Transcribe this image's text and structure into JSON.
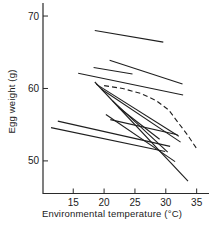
{
  "figure": {
    "background": "#ffffff",
    "line_color": "#1f1f1f",
    "axis_color": "#2a2a2a",
    "text_color": "#1a1a1a"
  },
  "chart_data": {
    "type": "line",
    "title": "",
    "xlabel": "Environmental temperature (°C)",
    "ylabel": "Egg weight (g)",
    "xlim": [
      10.1,
      37.0
    ],
    "ylim": [
      45.5,
      71.8
    ],
    "x_ticks": [
      15,
      20,
      25,
      30,
      35
    ],
    "y_ticks": [
      50,
      60,
      70
    ],
    "grid": false,
    "legend": "none",
    "series": [
      {
        "name": "line-1",
        "style": "solid",
        "points": [
          [
            18.5,
            68.0
          ],
          [
            29.6,
            66.4
          ]
        ]
      },
      {
        "name": "line-2",
        "style": "solid",
        "points": [
          [
            20.9,
            63.9
          ],
          [
            32.7,
            60.6
          ]
        ]
      },
      {
        "name": "line-3",
        "style": "solid",
        "points": [
          [
            15.8,
            62.1
          ],
          [
            32.8,
            59.1
          ]
        ]
      },
      {
        "name": "line-4",
        "style": "solid",
        "points": [
          [
            18.3,
            62.9
          ],
          [
            24.6,
            62.0
          ]
        ]
      },
      {
        "name": "line-5",
        "style": "solid",
        "points": [
          [
            18.5,
            60.9
          ],
          [
            33.6,
            47.2
          ]
        ]
      },
      {
        "name": "line-6",
        "style": "solid",
        "points": [
          [
            18.7,
            60.6
          ],
          [
            32.1,
            53.4
          ]
        ]
      },
      {
        "name": "line-7",
        "style": "solid",
        "points": [
          [
            19.6,
            59.9
          ],
          [
            32.4,
            52.6
          ]
        ]
      },
      {
        "name": "line-8",
        "style": "solid",
        "points": [
          [
            21.4,
            58.3
          ],
          [
            30.3,
            51.2
          ]
        ]
      },
      {
        "name": "line-9",
        "style": "solid",
        "points": [
          [
            22.3,
            57.4
          ],
          [
            29.0,
            53.0
          ]
        ]
      },
      {
        "name": "line-10",
        "style": "solid",
        "points": [
          [
            20.3,
            56.4
          ],
          [
            31.5,
            49.9
          ]
        ]
      },
      {
        "name": "line-11",
        "style": "solid",
        "points": [
          [
            21.0,
            55.7
          ],
          [
            31.9,
            53.6
          ]
        ]
      },
      {
        "name": "line-12",
        "style": "solid",
        "points": [
          [
            12.5,
            55.5
          ],
          [
            30.7,
            52.0
          ]
        ]
      },
      {
        "name": "line-13",
        "style": "solid",
        "points": [
          [
            11.4,
            54.6
          ],
          [
            29.9,
            51.3
          ]
        ]
      },
      {
        "name": "dashed-curve",
        "style": "dashed",
        "points": [
          [
            20.0,
            60.4
          ],
          [
            23.0,
            60.0
          ],
          [
            26.0,
            59.3
          ],
          [
            28.5,
            58.3
          ],
          [
            30.5,
            57.0
          ],
          [
            32.0,
            55.3
          ],
          [
            33.5,
            53.6
          ],
          [
            35.0,
            51.7
          ]
        ]
      }
    ]
  }
}
